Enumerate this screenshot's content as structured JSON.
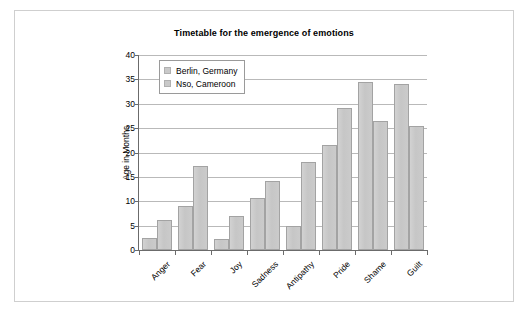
{
  "chart_data": {
    "type": "bar",
    "title": "Timetable for the emergence of emotions",
    "xlabel": "",
    "ylabel": "Age in Months",
    "ylim": [
      0,
      40
    ],
    "ytick_step": 5,
    "yticks": [
      0,
      5,
      10,
      15,
      20,
      25,
      30,
      35,
      40
    ],
    "grid": "horizontal",
    "legend_position": "top-left-inside",
    "categories": [
      "Anger",
      "Fear",
      "Joy",
      "Sadness",
      "Antipathy",
      "Pride",
      "Shame",
      "Guilt"
    ],
    "series": [
      {
        "name": "Berlin, Germany",
        "color": "#c9c9c9",
        "values": [
          2.5,
          9.0,
          2.2,
          10.6,
          4.9,
          21.5,
          34.5,
          34.1
        ]
      },
      {
        "name": "Nso, Cameroon",
        "color": "#c9c9c9",
        "values": [
          6.1,
          17.3,
          7.0,
          14.1,
          18.0,
          29.1,
          26.4,
          25.4
        ]
      }
    ]
  },
  "legend": {
    "items": [
      {
        "label": "Berlin, Germany"
      },
      {
        "label": "Nso, Cameroon"
      }
    ]
  }
}
